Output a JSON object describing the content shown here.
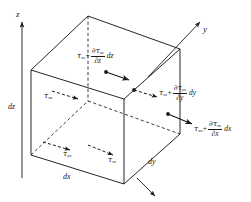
{
  "figure": {
    "type": "stress-element-cube",
    "background": "#ffffff",
    "line_color": "#1a1a1a"
  },
  "axes": {
    "z": {
      "label": "z",
      "direction": "up"
    },
    "y": {
      "label": "y",
      "direction": "upper-right"
    },
    "x": {
      "label": "x",
      "direction": "lower-right"
    }
  },
  "dimensions": [
    {
      "id": "dz",
      "label": "dz",
      "edge": "left-vertical"
    },
    {
      "id": "dx",
      "label": "dx",
      "edge": "bottom-front-left"
    },
    {
      "id": "dy",
      "label": "dy",
      "edge": "bottom-front-right"
    }
  ],
  "stresses": {
    "top_face": {
      "id": "tau-zx-plus-ddz",
      "base": "τ",
      "base_sub": "zx",
      "operator": "+",
      "numerator": "∂τ",
      "numerator_sub": "zx",
      "denominator": "∂z",
      "differential": "dz"
    },
    "right_face": {
      "id": "tau-zx-plus-ddy",
      "base": "τ",
      "base_sub": "zx",
      "operator": "+",
      "numerator": "∂τ",
      "numerator_sub": "yx",
      "denominator": "∂y",
      "differential": "dy"
    },
    "front_face": {
      "id": "tau-xx-plus-ddx",
      "base": "τ",
      "base_sub": "xx",
      "operator": "+",
      "numerator": "∂τ",
      "numerator_sub": "xx",
      "denominator": "∂x",
      "differential": "dx"
    },
    "back_face": {
      "id": "tau-xx",
      "base": "τ",
      "base_sub": "xx"
    },
    "bottom_left": {
      "id": "tau-yx",
      "base": "τ",
      "base_sub": "yx"
    },
    "bottom_right": {
      "id": "tau-zx",
      "base": "τ",
      "base_sub": "zx"
    }
  }
}
